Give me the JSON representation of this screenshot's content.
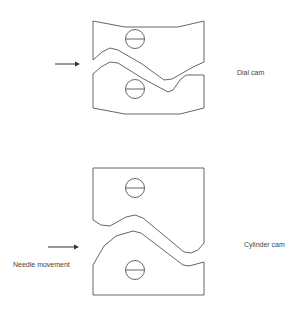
{
  "diagram": {
    "labels": {
      "dial_cam": "Dial cam",
      "cylinder_cam": "Cylinder cam",
      "needle_movement": "Needle movement"
    },
    "colors": {
      "stroke": "#555555",
      "background": "#ffffff",
      "text": "#444444"
    }
  }
}
